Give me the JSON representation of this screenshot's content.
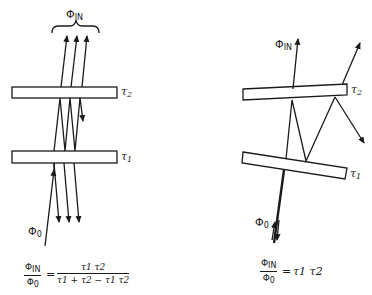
{
  "diagram": {
    "left": {
      "top_label": "Φ",
      "top_label_sub": "IN",
      "plate_top_label": "τ",
      "plate_top_sub": "2",
      "plate_bottom_label": "τ",
      "plate_bottom_sub": "1",
      "source_label": "Φ",
      "source_sub": "0",
      "formula": {
        "lhs_num": "Φ",
        "lhs_num_sub": "IN",
        "lhs_den": "Φ",
        "lhs_den_sub": "0",
        "equals": "=",
        "rhs_num": "τ1 τ2",
        "rhs_den": "τ1 + τ2 − τ1 τ2"
      }
    },
    "right": {
      "top_label": "Φ",
      "top_label_sub": "IN",
      "plate_top_label": "τ",
      "plate_top_sub": "2",
      "plate_bottom_label": "τ",
      "plate_bottom_sub": "1",
      "source_label": "Φ",
      "source_sub": "0",
      "formula": {
        "lhs_num": "Φ",
        "lhs_num_sub": "IN",
        "lhs_den": "Φ",
        "lhs_den_sub": "0",
        "equals": "=",
        "rhs": "τ1 τ2"
      }
    },
    "colors": {
      "ink": "#1a1a1a",
      "background": "#ffffff"
    }
  }
}
